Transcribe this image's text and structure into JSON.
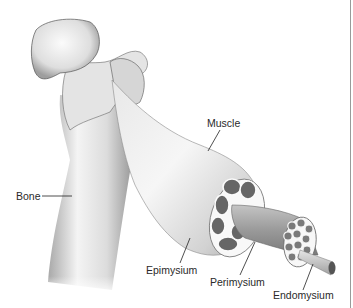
{
  "diagram": {
    "type": "anatomical-illustration",
    "labels": [
      {
        "id": "muscle",
        "text": "Muscle"
      },
      {
        "id": "bone",
        "text": "Bone"
      },
      {
        "id": "epimysium",
        "text": "Epimysium"
      },
      {
        "id": "perimysium",
        "text": "Perimysium"
      },
      {
        "id": "endomysium",
        "text": "Endomysium"
      }
    ]
  },
  "colors": {
    "background": "#ffffff",
    "bone_light": "#f2f2f2",
    "bone_shadow": "#9c9c9c",
    "muscle_light": "#efefef",
    "muscle_shadow": "#a8a8a8",
    "fascicle_fill": "#6a6a6a",
    "sheath_white": "#fafafa",
    "leader_line": "#222222",
    "label_text": "#2a2a2a"
  }
}
